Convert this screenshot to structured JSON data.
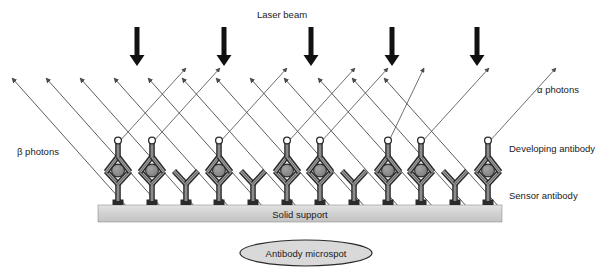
{
  "figure": {
    "type": "schematic-diagram",
    "background_color": "#ffffff"
  },
  "labels": {
    "laser_beam": "Laser beam",
    "alpha_photons": "α photons",
    "beta_photons": "β photons",
    "developing_antibody": "Developing antibody",
    "sensor_antibody": "Sensor antibody",
    "solid_support": "Solid support",
    "antibody_microspot": "Antibody microspot"
  },
  "colors": {
    "ink": "#1a1a1a",
    "arrow_black": "#111111",
    "ray_line": "#4a4a4a",
    "antibody_dark": "#2b2b2b",
    "antibody_mid": "#6e6e6e",
    "antibody_light": "#b8b8b8",
    "antigen_fill": "#8a8a8a",
    "support_fill": "#d4d4d4",
    "support_edge": "#8f8f8f",
    "microspot_fill": "#d9d9d9",
    "microspot_edge": "#2b2b2b",
    "top_circle_fill": "#ffffff"
  },
  "laser_arrows": {
    "count": 5,
    "x_positions": [
      137,
      224,
      311,
      392,
      477
    ],
    "y_top": 27,
    "y_bottom": 66,
    "shaft_width": 5,
    "head_width": 15,
    "head_height": 11
  },
  "support": {
    "x": 98,
    "y": 205,
    "width": 404,
    "height": 17
  },
  "microspot": {
    "cx": 306,
    "cy": 253,
    "rx": 66,
    "ry": 13
  },
  "complexes": {
    "note": "x = base anchor on support; kind=full has developing antibody, antigen and top circle; kind=sensor is bare Y sensor antibody only",
    "base_y": 205,
    "items": [
      {
        "x": 118,
        "kind": "full"
      },
      {
        "x": 152,
        "kind": "full"
      },
      {
        "x": 186,
        "kind": "sensor"
      },
      {
        "x": 219,
        "kind": "full"
      },
      {
        "x": 253,
        "kind": "sensor"
      },
      {
        "x": 287,
        "kind": "full"
      },
      {
        "x": 320,
        "kind": "full"
      },
      {
        "x": 354,
        "kind": "sensor"
      },
      {
        "x": 388,
        "kind": "full"
      },
      {
        "x": 421,
        "kind": "full"
      },
      {
        "x": 455,
        "kind": "sensor"
      },
      {
        "x": 488,
        "kind": "full"
      }
    ]
  },
  "beta_rays": {
    "note": "rays travelling up-left, arrowhead at upper-left end",
    "items": [
      {
        "x1": 128,
        "y1": 208,
        "x2": 12,
        "y2": 78
      },
      {
        "x1": 162,
        "y1": 208,
        "x2": 46,
        "y2": 78
      },
      {
        "x1": 196,
        "y1": 208,
        "x2": 80,
        "y2": 78
      },
      {
        "x1": 230,
        "y1": 208,
        "x2": 114,
        "y2": 78
      },
      {
        "x1": 264,
        "y1": 208,
        "x2": 148,
        "y2": 78
      },
      {
        "x1": 298,
        "y1": 208,
        "x2": 182,
        "y2": 78
      },
      {
        "x1": 332,
        "y1": 208,
        "x2": 216,
        "y2": 78
      },
      {
        "x1": 366,
        "y1": 208,
        "x2": 250,
        "y2": 78
      },
      {
        "x1": 400,
        "y1": 208,
        "x2": 284,
        "y2": 78
      },
      {
        "x1": 434,
        "y1": 208,
        "x2": 318,
        "y2": 78
      },
      {
        "x1": 468,
        "y1": 208,
        "x2": 352,
        "y2": 78
      },
      {
        "x1": 500,
        "y1": 208,
        "x2": 384,
        "y2": 78
      }
    ]
  },
  "alpha_rays": {
    "note": "rays travelling up-right from the top circle of each full complex, arrowhead at upper-right end",
    "items": [
      {
        "x1": 118,
        "y1": 143,
        "x2": 186,
        "y2": 68
      },
      {
        "x1": 152,
        "y1": 143,
        "x2": 220,
        "y2": 68
      },
      {
        "x1": 219,
        "y1": 143,
        "x2": 287,
        "y2": 68
      },
      {
        "x1": 287,
        "y1": 143,
        "x2": 355,
        "y2": 68
      },
      {
        "x1": 320,
        "y1": 143,
        "x2": 388,
        "y2": 68
      },
      {
        "x1": 388,
        "y1": 143,
        "x2": 424,
        "y2": 68
      },
      {
        "x1": 421,
        "y1": 143,
        "x2": 489,
        "y2": 68
      },
      {
        "x1": 488,
        "y1": 143,
        "x2": 556,
        "y2": 68
      }
    ]
  },
  "label_positions": {
    "laser_beam": {
      "x": 282,
      "y": 18,
      "anchor": "middle"
    },
    "alpha_photons": {
      "x": 537,
      "y": 93,
      "anchor": "start"
    },
    "beta_photons": {
      "x": 17,
      "y": 155,
      "anchor": "start"
    },
    "developing_antibody": {
      "x": 509,
      "y": 152,
      "anchor": "start"
    },
    "sensor_antibody": {
      "x": 509,
      "y": 199,
      "anchor": "start"
    },
    "solid_support": {
      "x": 300,
      "y": 218,
      "anchor": "middle"
    },
    "antibody_microspot": {
      "x": 306,
      "y": 257,
      "anchor": "middle"
    }
  }
}
